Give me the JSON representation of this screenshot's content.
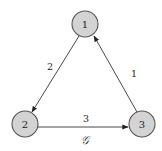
{
  "graph": {
    "name": "𝒢",
    "nodes": [
      {
        "id": "1",
        "label": "1",
        "x": 85,
        "y": 24
      },
      {
        "id": "2",
        "label": "2",
        "x": 25,
        "y": 124
      },
      {
        "id": "3",
        "label": "3",
        "x": 142,
        "y": 124
      }
    ],
    "edges": [
      {
        "from": "1",
        "to": "2",
        "weight": "2"
      },
      {
        "from": "2",
        "to": "3",
        "weight": "3"
      },
      {
        "from": "3",
        "to": "1",
        "weight": "1"
      }
    ]
  }
}
